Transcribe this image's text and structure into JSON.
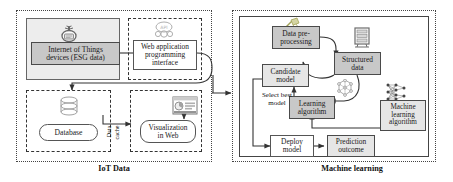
{
  "figure": {
    "type": "block-diagram",
    "panels": [
      {
        "id": "iot",
        "caption": "IoT Data"
      },
      {
        "id": "ml",
        "caption": "Machine learning"
      }
    ]
  },
  "iot_panel": {
    "caption": "IoT Data",
    "nodes": [
      {
        "id": "iot-devices",
        "label": "Internet of Things\ndevices (ESG data)",
        "line1": "Internet of Things",
        "line2": "devices (ESG data)",
        "style": "shaded"
      },
      {
        "id": "web-api",
        "label": "Web application\nprogramming\ninterface",
        "line1": "Web application",
        "line2": "programming",
        "line3": "interface",
        "style": "plain"
      },
      {
        "id": "database",
        "label": "Database",
        "line1": "Database",
        "style": "rounded"
      },
      {
        "id": "visualization",
        "label": "Visualization\nin Web",
        "line1": "Visualization",
        "line2": "in Web",
        "style": "rounded"
      }
    ],
    "icons": [
      {
        "id": "iot-device-icon",
        "name": "iot-device-icon"
      },
      {
        "id": "api-cloud-icon",
        "name": "api-cloud-icon"
      },
      {
        "id": "database-cylinder-icon",
        "name": "database-cylinder-icon"
      },
      {
        "id": "web-dashboard-icon",
        "name": "web-dashboard-icon"
      }
    ],
    "edges": [
      {
        "from": "iot-devices",
        "to": "web-api",
        "label": ""
      },
      {
        "from": "web-api",
        "to": "database",
        "label": ""
      },
      {
        "from": "database",
        "to": "visualization",
        "label": "Data cache",
        "label_line1": "Data",
        "label_line2": "cache"
      }
    ]
  },
  "ml_panel": {
    "caption": "Machine learning",
    "nodes": [
      {
        "id": "data-preprocessing",
        "label": "Data pre-\nprocessing",
        "line1": "Data pre-",
        "line2": "processing",
        "style": "shaded"
      },
      {
        "id": "structured-data",
        "label": "Structured\ndata",
        "line1": "Structured",
        "line2": "data",
        "style": "shaded"
      },
      {
        "id": "candidate-model",
        "label": "Candidate\nmodel",
        "line1": "Candidate",
        "line2": "model",
        "style": "lightshade"
      },
      {
        "id": "learning-algorithm",
        "label": "Learning\nalgorithm",
        "line1": "Learning",
        "line2": "algorithm",
        "style": "shaded"
      },
      {
        "id": "machine-learning-algorithm",
        "label": "Machine\nlearning\nalgorithm",
        "line1": "Machine",
        "line2": "learning",
        "line3": "algorithm",
        "style": "lightshade"
      },
      {
        "id": "deploy-model",
        "label": "Deploy\nmodel",
        "line1": "Deploy",
        "line2": "model",
        "style": "plain"
      },
      {
        "id": "prediction-outcome",
        "label": "Prediction\noutcome",
        "line1": "Prediction",
        "line2": "outcome",
        "style": "lightshade"
      }
    ],
    "icons": [
      {
        "id": "data-cleaning-icon",
        "name": "data-cleaning-icon"
      },
      {
        "id": "server-rack-icon",
        "name": "server-rack-icon"
      },
      {
        "id": "network-graph-icon",
        "name": "network-graph-icon"
      },
      {
        "id": "neural-network-icon",
        "name": "neural-network-icon"
      }
    ],
    "edges": [
      {
        "from": "data-preprocessing",
        "to": "structured-data",
        "label": ""
      },
      {
        "from": "structured-data",
        "to": "data-preprocessing",
        "label": ""
      },
      {
        "from": "structured-data",
        "to": "learning-algorithm",
        "label": ""
      },
      {
        "from": "machine-learning-algorithm",
        "to": "learning-algorithm",
        "label": ""
      },
      {
        "from": "learning-algorithm",
        "to": "candidate-model",
        "label": ""
      },
      {
        "from": "candidate-model",
        "to": "deploy-model",
        "label": "Select best model",
        "label_line1": "Select best",
        "label_line2": "model"
      },
      {
        "from": "deploy-model",
        "to": "prediction-outcome",
        "label": ""
      }
    ]
  },
  "colors": {
    "shaded_fill": "#c8c8c8",
    "light_fill": "#e6e6e6",
    "stroke": "#555555",
    "background": "#ffffff"
  }
}
